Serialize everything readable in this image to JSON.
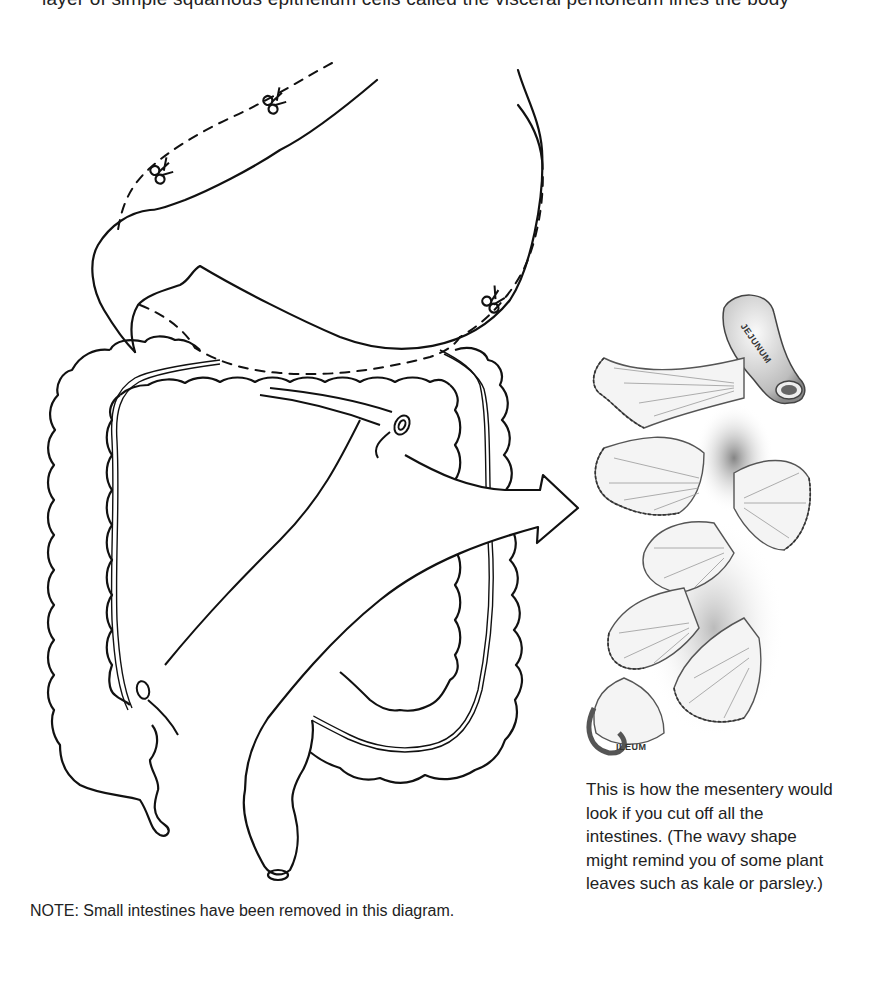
{
  "page": {
    "top_line_partial": "layer of simple squamous epithelium cells called the visceral peritoneum lines the body",
    "background": "#ffffff"
  },
  "diagram": {
    "cut_marks": [
      "scissors-icon",
      "scissors-icon",
      "scissors-icon",
      "scissors-icon"
    ],
    "arrow_direction": "right",
    "stroke_color": "#111111"
  },
  "illustration": {
    "labels": {
      "jejunum": "JEJUNUM",
      "ileum": "ILEUM"
    },
    "shading_color": "#8a8a8a"
  },
  "caption": {
    "text": "This is how the mesentery would look if you cut off all the intestines.  (The wavy shape might remind you of some plant leaves such as kale or parsley.)"
  },
  "note": {
    "text": "NOTE:  Small intestines have been removed in this diagram."
  }
}
